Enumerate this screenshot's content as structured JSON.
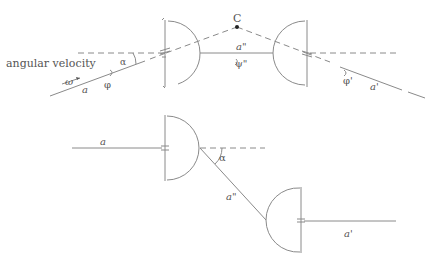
{
  "diagram": {
    "colors": {
      "line": "#8a8a8a",
      "text": "#555555",
      "point": "#222222"
    },
    "top": {
      "label_angular_velocity": "angular velocity",
      "label_omega": "ω",
      "label_input_shaft": "a",
      "label_input_angle": "φ",
      "label_angle_alpha": "α",
      "label_point": "C",
      "label_intermediate_shaft": "a\"",
      "label_intermediate_angle": "ψ\"",
      "label_output_angle": "φ'",
      "label_output_shaft": "a'"
    },
    "bottom": {
      "label_input_shaft": "a",
      "label_angle_alpha": "α",
      "label_intermediate_shaft": "a\"",
      "label_output_shaft": "a'"
    }
  }
}
